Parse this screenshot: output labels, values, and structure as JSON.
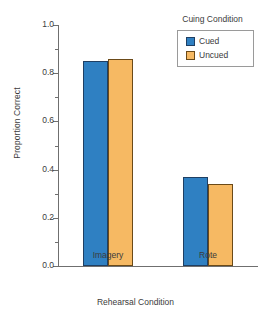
{
  "chart_data": {
    "type": "bar",
    "title": "",
    "xlabel": "Rehearsal Condition",
    "ylabel": "Proportion Correct",
    "categories": [
      "Imagery",
      "Rote"
    ],
    "series": [
      {
        "name": "Cued",
        "values": [
          0.85,
          0.37
        ],
        "color": "#2f80c2"
      },
      {
        "name": "Uncued",
        "values": [
          0.86,
          0.34
        ],
        "color": "#f6b963"
      }
    ],
    "ylim": [
      0.0,
      1.0
    ],
    "ytick_labels": [
      "0.0",
      "0.2",
      "0.4",
      "0.6",
      "0.8",
      "1.0"
    ],
    "ytick_values": [
      0.0,
      0.2,
      0.4,
      0.6,
      0.8,
      1.0
    ],
    "yminor_values": [
      0.1,
      0.3,
      0.5,
      0.7,
      0.9
    ],
    "grid": false,
    "legend": {
      "title": "Cuing Condition",
      "position": "top-right",
      "entries": [
        {
          "label": "Cued",
          "color": "#2f80c2"
        },
        {
          "label": "Uncued",
          "color": "#f6b963"
        }
      ]
    }
  },
  "axes": {
    "y_label": "Proportion Correct",
    "x_label": "Rehearsal Condition",
    "y_ticks": [
      {
        "label": "1.0",
        "value": 1.0
      },
      {
        "label": "0.8",
        "value": 0.8
      },
      {
        "label": "0.6",
        "value": 0.6
      },
      {
        "label": "0.4",
        "value": 0.4
      },
      {
        "label": "0.2",
        "value": 0.2
      },
      {
        "label": "0.0",
        "value": 0.0
      }
    ],
    "x_ticks": [
      {
        "label": "Imagery"
      },
      {
        "label": "Rote"
      }
    ]
  },
  "legend": {
    "title": "Cuing Condition",
    "items": [
      {
        "label": "Cued"
      },
      {
        "label": "Uncued"
      }
    ]
  },
  "colors": {
    "cued": "#2f80c2",
    "uncued": "#f6b963",
    "axis": "#6f6f6f",
    "text": "#3b3b3b",
    "background": "#ffffff"
  }
}
